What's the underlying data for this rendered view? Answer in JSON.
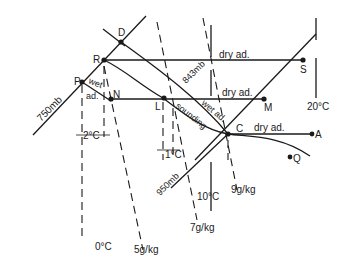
{
  "diagram": {
    "type": "tephigram-style thermodynamic diagram",
    "points": {
      "D": "D",
      "R": "R",
      "P": "P",
      "N": "N",
      "L": "L",
      "M": "M",
      "S": "S",
      "C": "C",
      "A": "A",
      "Q": "Q"
    },
    "isobars": {
      "p750": "750mb",
      "p843": "843mb",
      "p950": "950mb"
    },
    "isotherms": {
      "t0": "0°C",
      "t10": "10°C",
      "t20": "20°C"
    },
    "mixing_ratio_lines": {
      "m5": "5g/kg",
      "m7": "7g/kg",
      "m9": "9g/kg"
    },
    "process_labels": {
      "dry_ad_top": "dry ad.",
      "dry_ad_mid": "dry ad.",
      "dry_ad_low": "dry ad.",
      "wet_ad_diag": "wet ad.",
      "wet_ad_p_1": "wet",
      "wet_ad_p_2": "ad.",
      "sounding": "sounding"
    },
    "intervals": {
      "left_gap": "2°C",
      "right_gap": "1°C"
    }
  }
}
